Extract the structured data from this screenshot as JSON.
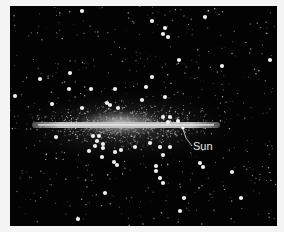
{
  "diagram": {
    "labels": {
      "sun": "Sun"
    },
    "colors": {
      "background": "#030303",
      "frame": "#f4f4f4",
      "disk": "#bdbdbd",
      "disk_core": "#e6e6e6",
      "stars": "#cfcfcf",
      "globular_clusters": "#f0f0f0",
      "label": "#e8e8e8"
    },
    "globular_clusters": [
      [
        82,
        11
      ],
      [
        152,
        21
      ],
      [
        165,
        28
      ],
      [
        163,
        34
      ],
      [
        168,
        37
      ],
      [
        205,
        17
      ],
      [
        179,
        60
      ],
      [
        270,
        60
      ],
      [
        15,
        96
      ],
      [
        40,
        79
      ],
      [
        70,
        73
      ],
      [
        152,
        77
      ],
      [
        69,
        89
      ],
      [
        91,
        89
      ],
      [
        115,
        89
      ],
      [
        146,
        87
      ],
      [
        165,
        97
      ],
      [
        142,
        100
      ],
      [
        107,
        103
      ],
      [
        52,
        104
      ],
      [
        82,
        108
      ],
      [
        110,
        105
      ],
      [
        118,
        108
      ],
      [
        163,
        117
      ],
      [
        170,
        117
      ],
      [
        168,
        122
      ],
      [
        178,
        121
      ],
      [
        56,
        137
      ],
      [
        93,
        136
      ],
      [
        99,
        136
      ],
      [
        97,
        141
      ],
      [
        103,
        144
      ],
      [
        95,
        146
      ],
      [
        103,
        148
      ],
      [
        115,
        152
      ],
      [
        121,
        150
      ],
      [
        135,
        147
      ],
      [
        150,
        143
      ],
      [
        160,
        147
      ],
      [
        170,
        147
      ],
      [
        163,
        155
      ],
      [
        89,
        151
      ],
      [
        102,
        157
      ],
      [
        114,
        162
      ],
      [
        117,
        165
      ],
      [
        156,
        166
      ],
      [
        156,
        171
      ],
      [
        160,
        178
      ],
      [
        163,
        183
      ],
      [
        200,
        163
      ],
      [
        203,
        167
      ],
      [
        232,
        172
      ],
      [
        184,
        198
      ],
      [
        241,
        198
      ],
      [
        180,
        211
      ],
      [
        105,
        193
      ],
      [
        78,
        219
      ],
      [
        222,
        66
      ]
    ]
  }
}
